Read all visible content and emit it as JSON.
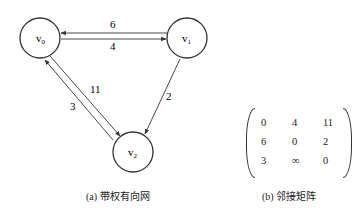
{
  "graph": {
    "nodes": [
      {
        "id": "v0",
        "base": "v",
        "sub": "0"
      },
      {
        "id": "v1",
        "base": "v",
        "sub": "1"
      },
      {
        "id": "v2",
        "base": "v",
        "sub": "2"
      }
    ],
    "edges": [
      {
        "from": "v1",
        "to": "v0",
        "weight": "6"
      },
      {
        "from": "v0",
        "to": "v1",
        "weight": "4"
      },
      {
        "from": "v0",
        "to": "v2",
        "weight": "11"
      },
      {
        "from": "v2",
        "to": "v0",
        "weight": "3"
      },
      {
        "from": "v1",
        "to": "v2",
        "weight": "2"
      }
    ],
    "caption": "(a)  带权有向网"
  },
  "matrix": {
    "rows": [
      [
        "0",
        "4",
        "11"
      ],
      [
        "6",
        "0",
        "2"
      ],
      [
        "3",
        "∞",
        "0"
      ]
    ],
    "caption": "(b)  邻接矩阵"
  },
  "colors": {
    "stroke": "#333333",
    "text": "#222222"
  }
}
